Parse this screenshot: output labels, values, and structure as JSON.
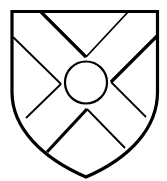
{
  "figure": {
    "description": "Heraldic shield with a saltire (X-cross) and a central roundel",
    "background": "#ffffff",
    "stroke_color": "#000000",
    "fill_color": "#ffffff"
  },
  "shield": {
    "name": "shield-outline",
    "stroke_width": 3.2,
    "top_left": [
      12,
      11.5
    ],
    "top_right": [
      157.5,
      11.5
    ],
    "bottom_point": [
      86,
      177
    ],
    "path": "M12,11.5 L157.5,11.5 L157.5,92 C157.5,128 130,158 86,177 C42,158 12,128 12,92 Z"
  },
  "roundel": {
    "name": "central-roundel",
    "cx": 86,
    "cy": 82.5,
    "r": 21,
    "stroke_width": 2.2
  },
  "saltire": {
    "name": "saltire-cross",
    "edges": [
      {
        "name": "upper-left-thick-edge",
        "points": [
          [
            41,
            12
          ],
          [
            86,
            57
          ]
        ],
        "stroke_width": 3.2
      },
      {
        "name": "upper-right-thin-edge",
        "points": [
          [
            86,
            57
          ],
          [
            128,
            12
          ]
        ],
        "stroke_width": 1.8
      },
      {
        "name": "left-upper-thin-edge",
        "points": [
          [
            13,
            37
          ],
          [
            61,
            84
          ]
        ],
        "stroke_width": 1.8
      },
      {
        "name": "left-lower-thin-edge",
        "points": [
          [
            61,
            84
          ],
          [
            26,
            118
          ]
        ],
        "stroke_width": 1.8
      },
      {
        "name": "right-upper-thick-edge",
        "points": [
          [
            157,
            36
          ],
          [
            111,
            82
          ]
        ],
        "stroke_width": 3.2
      },
      {
        "name": "right-lower-thin-edge",
        "points": [
          [
            111,
            82
          ],
          [
            146,
            117
          ]
        ],
        "stroke_width": 1.8
      },
      {
        "name": "lower-left-thick-edge",
        "points": [
          [
            87,
            109
          ],
          [
            47,
            152
          ]
        ],
        "stroke_width": 3.2
      },
      {
        "name": "lower-right-thin-edge",
        "points": [
          [
            87,
            109
          ],
          [
            125,
            148
          ]
        ],
        "stroke_width": 1.8
      }
    ]
  }
}
